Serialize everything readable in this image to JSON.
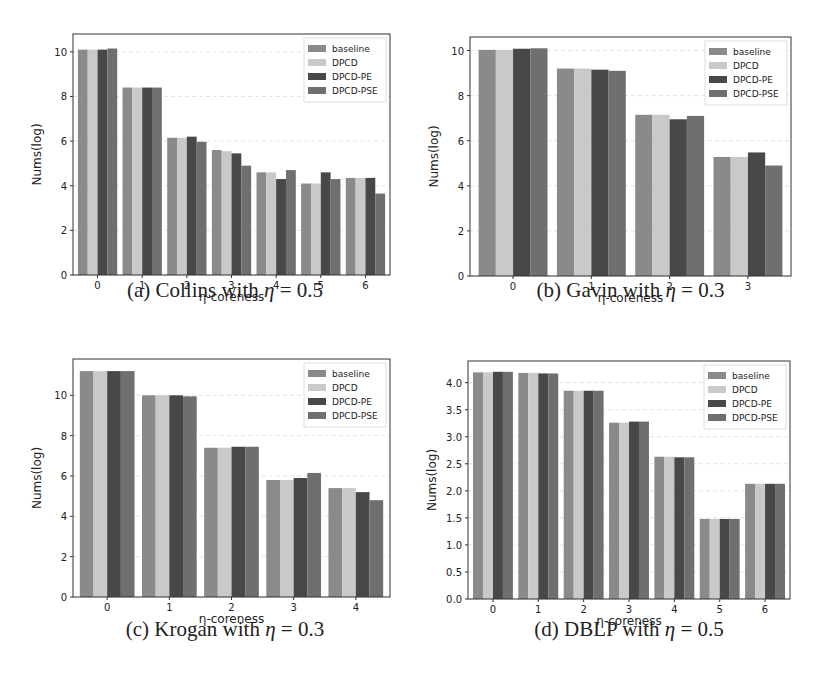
{
  "colors": {
    "baseline": "#8a8a8a",
    "DPCD": "#c9c9c9",
    "DPCD-PE": "#484848",
    "DPCD-PSE": "#6f6f6f",
    "grid": "#e2e2e2",
    "axis": "#333333"
  },
  "chart_data": [
    {
      "type": "bar",
      "id": "a",
      "title": "",
      "caption": "(a) Collins with η = 0.5",
      "caption_prefix": "(a) Collins with ",
      "caption_eta": "η",
      "caption_suffix": " = 0.5",
      "xlabel": "η-coreness",
      "ylabel": "Nums(log)",
      "categories": [
        "0",
        "1",
        "2",
        "3",
        "4",
        "5",
        "6"
      ],
      "ylim": [
        0,
        10.8
      ],
      "yticks": [
        0,
        2,
        4,
        6,
        8,
        10
      ],
      "ytick_labels": [
        "0",
        "2",
        "4",
        "6",
        "8",
        "10"
      ],
      "grid": true,
      "legend_position": "upper right",
      "series": [
        {
          "name": "baseline",
          "values": [
            10.1,
            8.4,
            6.15,
            5.6,
            4.6,
            4.1,
            4.35
          ]
        },
        {
          "name": "DPCD",
          "values": [
            10.1,
            8.4,
            6.15,
            5.55,
            4.6,
            4.1,
            4.35
          ]
        },
        {
          "name": "DPCD-PE",
          "values": [
            10.1,
            8.4,
            6.2,
            5.45,
            4.3,
            4.6,
            4.35
          ]
        },
        {
          "name": "DPCD-PSE",
          "values": [
            10.15,
            8.4,
            5.97,
            4.9,
            4.7,
            4.3,
            3.65
          ]
        }
      ]
    },
    {
      "type": "bar",
      "id": "b",
      "title": "",
      "caption": "(b) Gavin with η = 0.3",
      "caption_prefix": "(b) Gavin with ",
      "caption_eta": "η",
      "caption_suffix": " = 0.3",
      "xlabel": "η-coreness",
      "ylabel": "Nums(log)",
      "categories": [
        "0",
        "1",
        "2",
        "3"
      ],
      "ylim": [
        0,
        10.6
      ],
      "yticks": [
        0,
        2,
        4,
        6,
        8,
        10
      ],
      "ytick_labels": [
        "0",
        "2",
        "4",
        "6",
        "8",
        "10"
      ],
      "grid": true,
      "legend_position": "upper right",
      "series": [
        {
          "name": "baseline",
          "values": [
            10.03,
            9.2,
            7.15,
            5.28
          ]
        },
        {
          "name": "DPCD",
          "values": [
            10.03,
            9.2,
            7.15,
            5.28
          ]
        },
        {
          "name": "DPCD-PE",
          "values": [
            10.08,
            9.15,
            6.95,
            5.48
          ]
        },
        {
          "name": "DPCD-PSE",
          "values": [
            10.1,
            9.1,
            7.1,
            4.9
          ]
        }
      ]
    },
    {
      "type": "bar",
      "id": "c",
      "title": "",
      "caption": "(c) Krogan with η = 0.3",
      "caption_prefix": "(c) Krogan with ",
      "caption_eta": "η",
      "caption_suffix": " = 0.3",
      "xlabel": "η-coreness",
      "ylabel": "Nums(log)",
      "categories": [
        "0",
        "1",
        "2",
        "3",
        "4"
      ],
      "ylim": [
        0,
        11.8
      ],
      "yticks": [
        0,
        2,
        4,
        6,
        8,
        10
      ],
      "ytick_labels": [
        "0",
        "2",
        "4",
        "6",
        "8",
        "10"
      ],
      "grid": true,
      "legend_position": "upper right",
      "series": [
        {
          "name": "baseline",
          "values": [
            11.2,
            10.0,
            7.4,
            5.8,
            5.4
          ]
        },
        {
          "name": "DPCD",
          "values": [
            11.2,
            10.0,
            7.4,
            5.8,
            5.4
          ]
        },
        {
          "name": "DPCD-PE",
          "values": [
            11.2,
            10.0,
            7.45,
            5.9,
            5.2
          ]
        },
        {
          "name": "DPCD-PSE",
          "values": [
            11.2,
            9.95,
            7.45,
            6.15,
            4.8
          ]
        }
      ]
    },
    {
      "type": "bar",
      "id": "d",
      "title": "",
      "caption": "(d) DBLP with η = 0.5",
      "caption_prefix": "(d) DBLP with ",
      "caption_eta": "η",
      "caption_suffix": " = 0.5",
      "xlabel": "η-coreness",
      "ylabel": "Nums(log)",
      "categories": [
        "0",
        "1",
        "2",
        "3",
        "4",
        "5",
        "6"
      ],
      "ylim": [
        0,
        4.4
      ],
      "yticks": [
        0,
        0.5,
        1,
        1.5,
        2,
        2.5,
        3,
        3.5,
        4
      ],
      "ytick_labels": [
        "0.0",
        "0.5",
        "1.0",
        "1.5",
        "2.0",
        "2.5",
        "3.0",
        "3.5",
        "4.0"
      ],
      "grid": true,
      "legend_position": "upper right",
      "series": [
        {
          "name": "baseline",
          "values": [
            4.19,
            4.18,
            3.85,
            3.26,
            2.63,
            1.48,
            2.13
          ]
        },
        {
          "name": "DPCD",
          "values": [
            4.19,
            4.18,
            3.85,
            3.26,
            2.63,
            1.48,
            2.13
          ]
        },
        {
          "name": "DPCD-PE",
          "values": [
            4.2,
            4.17,
            3.85,
            3.28,
            2.62,
            1.48,
            2.13
          ]
        },
        {
          "name": "DPCD-PSE",
          "values": [
            4.2,
            4.17,
            3.85,
            3.28,
            2.62,
            1.48,
            2.13
          ]
        }
      ]
    }
  ]
}
